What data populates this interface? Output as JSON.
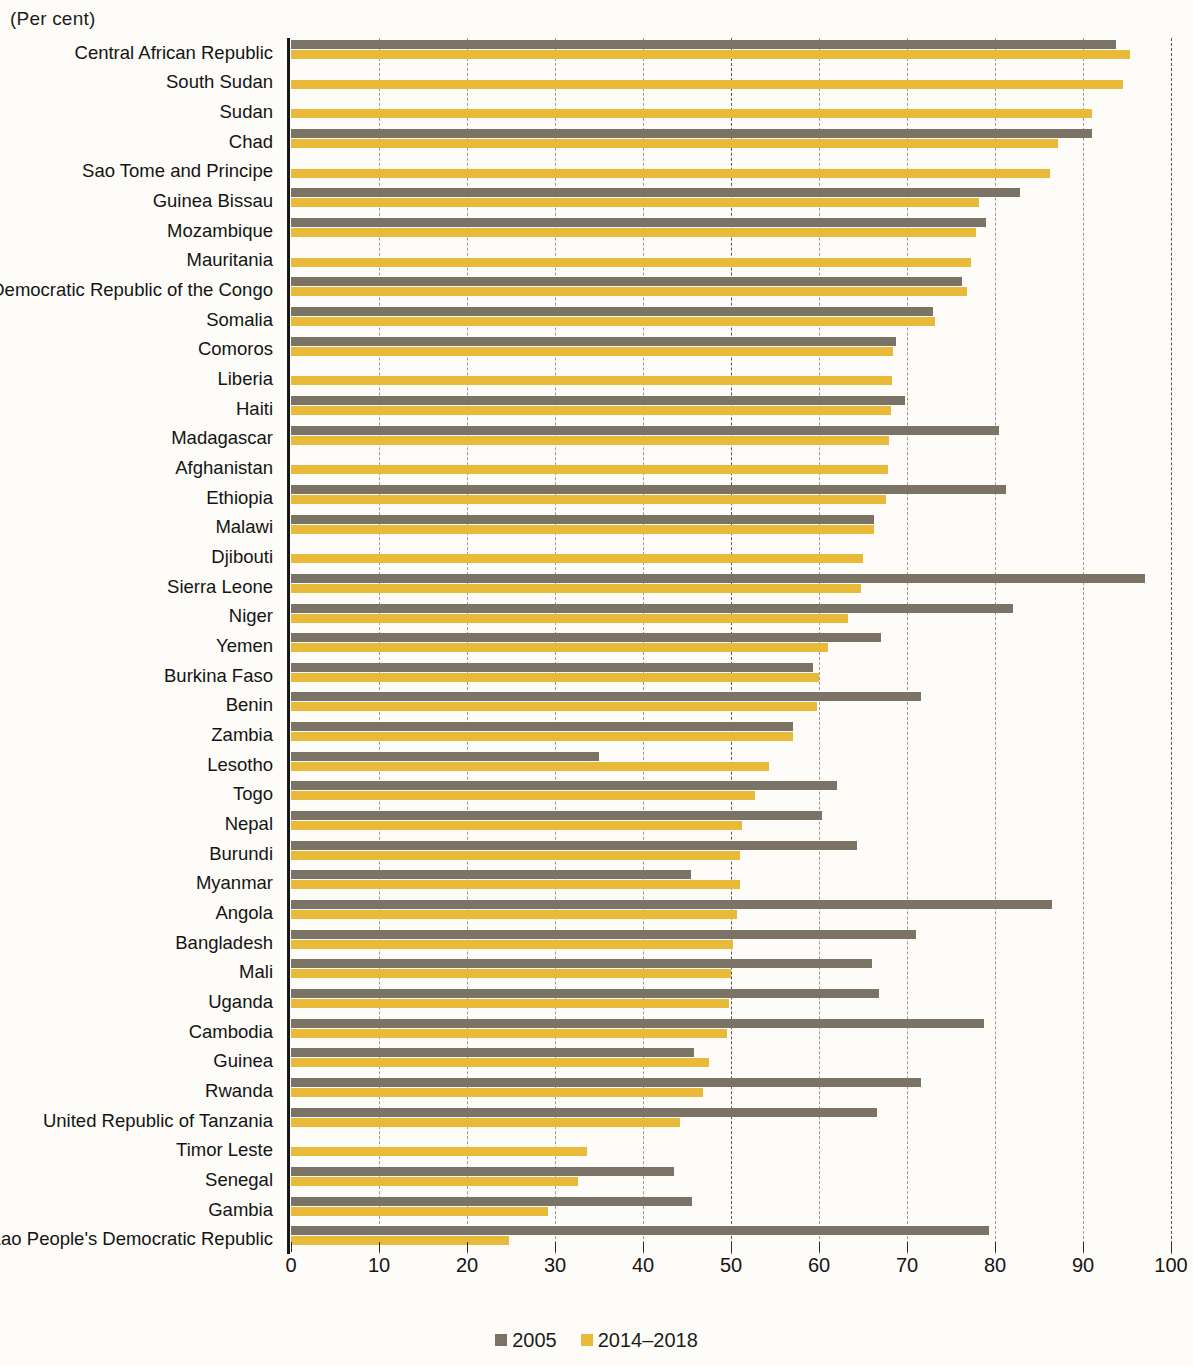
{
  "unit_label": "(Per cent)",
  "colors": {
    "series_2005": "#7c7367",
    "series_recent": "#e9ba3a",
    "axis": "#17171a",
    "grid": "#9a9a9a",
    "background": "#fdfcf8"
  },
  "axis": {
    "x_ticks": [
      0,
      10,
      20,
      30,
      40,
      50,
      60,
      70,
      80,
      90,
      100
    ],
    "x_min": 0,
    "x_max": 100
  },
  "legend": {
    "position": "bottom-center",
    "items": [
      {
        "label": "2005",
        "color": "#7c7367"
      },
      {
        "label": "2014–2018",
        "color": "#e9ba3a"
      }
    ]
  },
  "chart_data": {
    "type": "bar",
    "orientation": "horizontal",
    "title": "",
    "subtitle": "",
    "xlabel": "(Per cent)",
    "ylabel": "",
    "xlim": [
      0,
      100
    ],
    "grid": true,
    "legend_position": "bottom-center",
    "categories": [
      "Central African Republic",
      "South Sudan",
      "Sudan",
      "Chad",
      "Sao Tome and Principe",
      "Guinea Bissau",
      "Mozambique",
      "Mauritania",
      "Democratic Republic of the Congo",
      "Somalia",
      "Comoros",
      "Liberia",
      "Haiti",
      "Madagascar",
      "Afghanistan",
      "Ethiopia",
      "Malawi",
      "Djibouti",
      "Sierra Leone",
      "Niger",
      "Yemen",
      "Burkina  Faso",
      "Benin",
      "Zambia",
      "Lesotho",
      "Togo",
      "Nepal",
      "Burundi",
      "Myanmar",
      "Angola",
      "Bangladesh",
      "Mali",
      "Uganda",
      "Cambodia",
      "Guinea",
      "Rwanda",
      "United Republic of Tanzania",
      "Timor Leste",
      "Senegal",
      "Gambia",
      "Lao People's Democratic Republic"
    ],
    "series": [
      {
        "name": "2005",
        "color": "#7c7367",
        "values": [
          93.8,
          null,
          null,
          91.0,
          null,
          82.8,
          79.0,
          null,
          76.3,
          73.0,
          68.8,
          null,
          69.8,
          80.5,
          null,
          81.3,
          66.2,
          null,
          97.0,
          82.0,
          67.0,
          59.3,
          71.6,
          57.0,
          35.0,
          62.0,
          60.3,
          64.3,
          45.5,
          86.5,
          71.0,
          66.0,
          66.8,
          78.8,
          45.8,
          71.6,
          66.6,
          null,
          43.5,
          45.6,
          79.3
        ]
      },
      {
        "name": "2014–2018",
        "color": "#e9ba3a",
        "values": [
          95.3,
          94.6,
          91.0,
          87.2,
          86.2,
          78.2,
          77.8,
          77.3,
          76.8,
          73.2,
          68.4,
          68.3,
          68.2,
          68.0,
          67.8,
          67.6,
          66.3,
          65.0,
          64.8,
          63.3,
          61.0,
          60.0,
          59.8,
          57.0,
          54.3,
          52.7,
          51.3,
          51.0,
          51.0,
          50.7,
          50.2,
          50.0,
          49.8,
          49.5,
          47.5,
          46.8,
          44.2,
          33.6,
          32.6,
          29.2,
          24.8
        ]
      }
    ]
  }
}
